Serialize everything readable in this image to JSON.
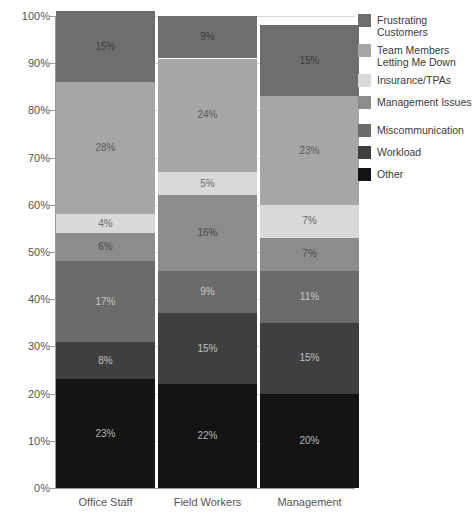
{
  "chart_data": {
    "type": "bar",
    "subtype": "stacked-percentage",
    "title": "",
    "subtitle": "",
    "xlabel": "",
    "ylabel": "",
    "ylim": [
      0,
      100
    ],
    "y_unit": "%",
    "grid": true,
    "legend_position": "right",
    "categories": [
      "Office Staff",
      "Field Workers",
      "Management"
    ],
    "y_ticks": [
      "0%",
      "10%",
      "20%",
      "30%",
      "40%",
      "50%",
      "60%",
      "70%",
      "80%",
      "90%",
      "100%"
    ],
    "y_tick_values": [
      0,
      10,
      20,
      30,
      40,
      50,
      60,
      70,
      80,
      90,
      100
    ],
    "series": [
      {
        "name": "Frustrating Customers",
        "legend_label": "Frustrating\nCustomers",
        "color": "#6e6e6e",
        "label_color": "#3d3d3d",
        "values": [
          15,
          9,
          15
        ],
        "data_labels": [
          "15%",
          "9%",
          "15%"
        ]
      },
      {
        "name": "Team Members Letting Me Down",
        "legend_label": "Team Members\nLetting Me Down",
        "color": "#a6a6a6",
        "label_color": "#5a5a5a",
        "values": [
          28,
          24,
          23
        ],
        "data_labels": [
          "28%",
          "24%",
          "23%"
        ]
      },
      {
        "name": "Insurance/TPAs",
        "legend_label": "Insurance/TPAs",
        "color": "#d9d9d9",
        "label_color": "#6b6b6b",
        "values": [
          4,
          5,
          7
        ],
        "data_labels": [
          "4%",
          "5%",
          "7%"
        ]
      },
      {
        "name": "Management Issues",
        "legend_label": "Management Issues",
        "color": "#8c8c8c",
        "label_color": "#4a4a4a",
        "values": [
          6,
          16,
          7
        ],
        "data_labels": [
          "6%",
          "16%",
          "7%"
        ]
      },
      {
        "name": "Miscommunication",
        "legend_label": "Miscommunication",
        "color": "#6b6b6b",
        "label_color": "#c8c8c8",
        "values": [
          17,
          9,
          11
        ],
        "data_labels": [
          "17%",
          "9%",
          "11%"
        ]
      },
      {
        "name": "Workload",
        "legend_label": "Workload",
        "color": "#3f3f3f",
        "label_color": "#c0c0c0",
        "values": [
          8,
          15,
          15
        ],
        "data_labels": [
          "8%",
          "15%",
          "15%"
        ]
      },
      {
        "name": "Other",
        "legend_label": "Other",
        "color": "#141414",
        "label_color": "#b5b5b5",
        "values": [
          23,
          22,
          20
        ],
        "data_labels": [
          "23%",
          "22%",
          "20%"
        ]
      }
    ]
  }
}
